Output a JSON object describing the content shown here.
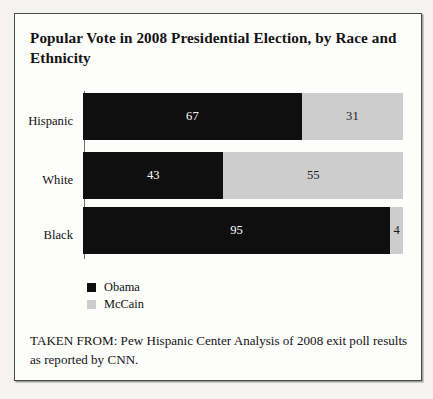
{
  "figure": {
    "title": "Popular Vote in 2008 Presidential Election, by Race and Ethnicity",
    "source_note": "TAKEN FROM: Pew Hispanic Center Analysis of 2008 exit poll results as reported by CNN."
  },
  "legend": {
    "items": [
      {
        "label": "Obama",
        "color": "#0f0f0f",
        "swatch_name": "legend-swatch-obama"
      },
      {
        "label": "McCain",
        "color": "#cdcdcd",
        "swatch_name": "legend-swatch-mccain"
      }
    ]
  },
  "chart_data": {
    "type": "bar",
    "orientation": "horizontal",
    "stacked": true,
    "title": "Popular Vote in 2008 Presidential Election, by Race and Ethnicity",
    "xlabel": "",
    "ylabel": "",
    "categories": [
      "Hispanic",
      "White",
      "Black"
    ],
    "series": [
      {
        "name": "Obama",
        "color": "#0f0f0f",
        "values": [
          67,
          43,
          95
        ]
      },
      {
        "name": "McCain",
        "color": "#cdcdcd",
        "values": [
          31,
          55,
          4
        ]
      }
    ],
    "value_labels": [
      {
        "category": "Hispanic",
        "obama": "67",
        "mccain": "31"
      },
      {
        "category": "White",
        "obama": "43",
        "mccain": "55"
      },
      {
        "category": "Black",
        "obama": "95",
        "mccain": "4"
      }
    ],
    "units": "percent",
    "xlim": [
      0,
      98
    ],
    "grid": false,
    "tick_labels": [],
    "legend_position": "bottom-left",
    "annotations": [
      "TAKEN FROM: Pew Hispanic Center Analysis of 2008 exit poll results as reported by CNN."
    ]
  }
}
